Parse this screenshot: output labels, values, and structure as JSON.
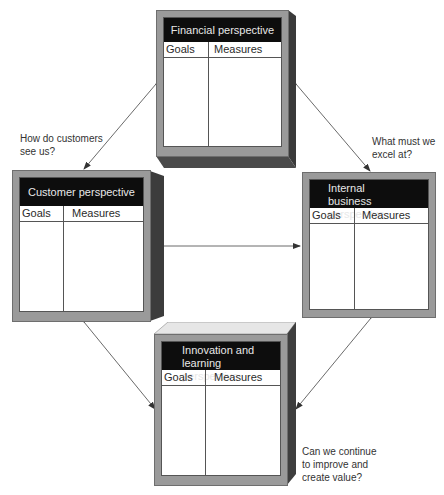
{
  "diagram": {
    "type": "balanced-scorecard",
    "perspectives": [
      {
        "id": "financial",
        "title": "Financial perspective",
        "columns": [
          "Goals",
          "Measures"
        ]
      },
      {
        "id": "customer",
        "title": "Customer perspective",
        "columns": [
          "Goals",
          "Measures"
        ]
      },
      {
        "id": "internal",
        "title_line1": "Internal",
        "title_line2": "business perspective",
        "columns": [
          "Goals",
          "Measures"
        ]
      },
      {
        "id": "innovation",
        "title_line1": "Innovation and",
        "title_line2": "learning perspective",
        "columns": [
          "Goals",
          "Measures"
        ]
      }
    ],
    "questions": {
      "customer_line1": "How do customers",
      "customer_line2": "see us?",
      "internal_line1": "What must we",
      "internal_line2": "excel at?",
      "innovation_line1": "Can we continue",
      "innovation_line2": "to improve and",
      "innovation_line3": "create value?"
    },
    "connections": [
      {
        "from": "financial",
        "to": "customer",
        "bidirectional": true
      },
      {
        "from": "financial",
        "to": "internal",
        "bidirectional": true
      },
      {
        "from": "customer",
        "to": "internal",
        "bidirectional": true
      },
      {
        "from": "customer",
        "to": "innovation",
        "bidirectional": true
      },
      {
        "from": "internal",
        "to": "innovation",
        "bidirectional": true
      }
    ],
    "colors": {
      "title_bar": "#0d0d0d",
      "frame": "#9a9a9a",
      "side_dark": "#3c3c3c",
      "arrow": "#333333"
    }
  }
}
